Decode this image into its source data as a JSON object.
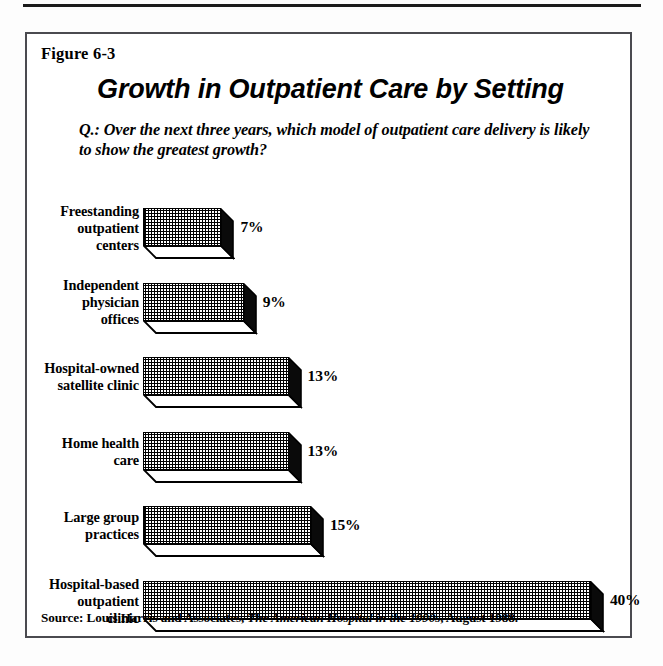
{
  "page": {
    "background": "#fdfdfd",
    "rule_color": "#1b1b1b",
    "box_border_color": "#4a4a50"
  },
  "figure": {
    "number_label": "Figure 6-3",
    "title": "Growth in Outpatient Care by Setting",
    "question": "Q.: Over the next three years, which model of outpatient care delivery is likely to show the greatest growth?",
    "source_prefix": "Source: Louis Harris and Associates,",
    "source_work": "The American Hospital in the 1990s",
    "source_suffix": ", August 1988."
  },
  "chart_data": {
    "type": "bar",
    "orientation": "horizontal",
    "style": "3d-extruded-bars-with-crosshatch-fill",
    "title": "Growth in Outpatient Care by Setting",
    "subtitle": "Q.: Over the next three years, which model of outpatient care delivery is likely to show the greatest growth?",
    "xlabel": "",
    "ylabel": "",
    "xlim": [
      0,
      40
    ],
    "grid": false,
    "legend": false,
    "value_suffix": "%",
    "categories": [
      "Freestanding outpatient centers",
      "Independent physician offices",
      "Hospital-owned satellite clinic",
      "Home health care",
      "Large group practices",
      "Hospital-based outpatient clinic"
    ],
    "values": [
      7,
      9,
      13,
      13,
      15,
      40
    ],
    "bars": [
      {
        "label_lines": [
          "Freestanding",
          "outpatient",
          "centers"
        ],
        "value": 7,
        "value_label": "7%"
      },
      {
        "label_lines": [
          "Independent",
          "physician",
          "offices"
        ],
        "value": 9,
        "value_label": "9%"
      },
      {
        "label_lines": [
          "Hospital-owned",
          "satellite clinic"
        ],
        "value": 13,
        "value_label": "13%"
      },
      {
        "label_lines": [
          "Home health",
          "care"
        ],
        "value": 13,
        "value_label": "13%"
      },
      {
        "label_lines": [
          "Large group",
          "practices"
        ],
        "value": 15,
        "value_label": "15%"
      },
      {
        "label_lines": [
          "Hospital-based",
          "outpatient",
          "clinic"
        ],
        "value": 40,
        "value_label": "40%"
      }
    ]
  }
}
